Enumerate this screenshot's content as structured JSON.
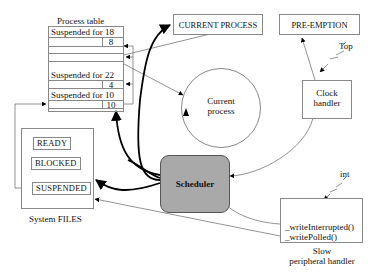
{
  "process_table": {
    "title": "Process table",
    "rows": [
      {
        "label": "Suspended for 18",
        "value": "8"
      },
      {
        "label": "",
        "value": ""
      },
      {
        "label": "Suspended for 22",
        "value": "4"
      },
      {
        "label": "Suspended for 10",
        "value": "10"
      }
    ]
  },
  "current_process_box": "CURRENT PROCESS",
  "preemption_box": "PRE-EMPTION",
  "current_process_circle": {
    "line1": "Current",
    "line2": "process"
  },
  "clock_handler": {
    "line1": "Clock",
    "line2": "handler",
    "signal": "Top"
  },
  "system_files": {
    "title": "System FILES",
    "states": [
      "READY",
      "BLOCKED",
      "SUSPENDED"
    ]
  },
  "scheduler": {
    "label": "Scheduler",
    "fill": "#a9a9a9"
  },
  "peripheral_handler": {
    "signal": "int",
    "functions": [
      "_writeInterrupted()",
      "_writePolled()"
    ],
    "caption_line1": "Slow",
    "caption_line2": "peripheral handler"
  }
}
